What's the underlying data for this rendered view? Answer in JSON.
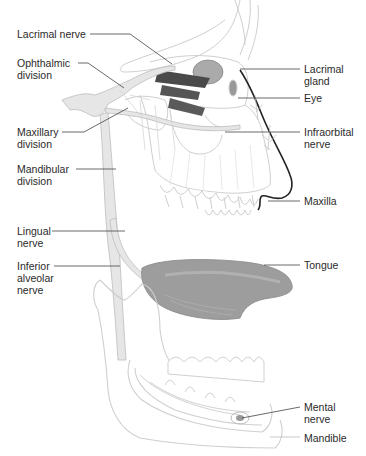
{
  "figure": {
    "colors": {
      "nerve": "#e6e6e6",
      "nerve_outline": "#bdbdbd",
      "bone_outline": "#c8c8c8",
      "muscle": "#555555",
      "tongue": "#9a9a9a",
      "leader_line": "#444444",
      "nose_outline": "#222222",
      "text": "#2a2a2a"
    }
  },
  "labels_left": [
    {
      "id": "lacrimal-nerve",
      "text": "Lacrimal nerve"
    },
    {
      "id": "ophthalmic-division",
      "text": "Ophthalmic\ndivision"
    },
    {
      "id": "maxillary-division",
      "text": "Maxillary\ndivision"
    },
    {
      "id": "mandibular-division",
      "text": "Mandibular\ndivision"
    },
    {
      "id": "lingual-nerve",
      "text": "Lingual\nnerve"
    },
    {
      "id": "inferior-alveolar-nerve",
      "text": "Inferior\nalveolar\nnerve"
    }
  ],
  "labels_right": [
    {
      "id": "lacrimal-gland",
      "text": "Lacrimal\ngland"
    },
    {
      "id": "eye",
      "text": "Eye"
    },
    {
      "id": "infraorbital-nerve",
      "text": "Infraorbital\nnerve"
    },
    {
      "id": "maxilla",
      "text": "Maxilla"
    },
    {
      "id": "tongue",
      "text": "Tongue"
    },
    {
      "id": "mental-nerve",
      "text": "Mental\nnerve"
    },
    {
      "id": "mandible",
      "text": "Mandible"
    }
  ]
}
